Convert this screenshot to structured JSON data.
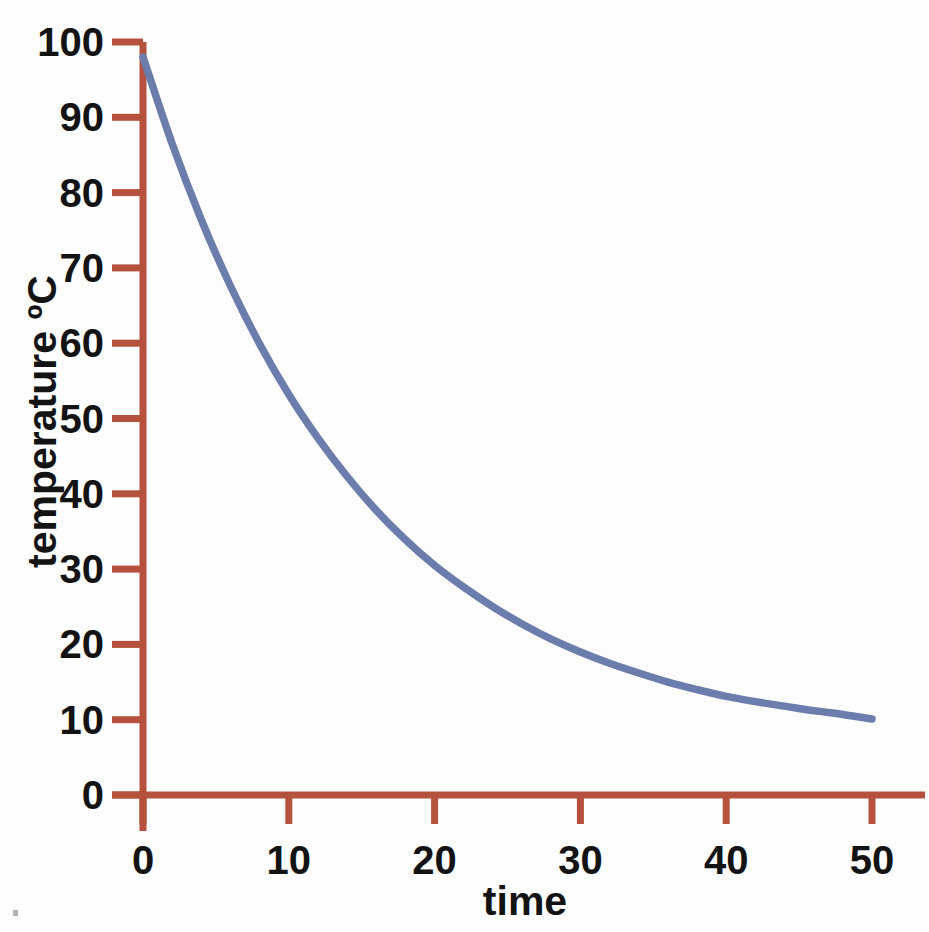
{
  "chart_data": {
    "type": "line",
    "title": "",
    "title_note": "title row is cropped off the top edge of the screenshot and is illegible",
    "xlabel": "time",
    "ylabel": "temperature ºC",
    "xlim": [
      0,
      50
    ],
    "ylim": [
      0,
      100
    ],
    "xticks": [
      0,
      10,
      20,
      30,
      40,
      50
    ],
    "yticks": [
      0,
      10,
      20,
      30,
      40,
      50,
      60,
      70,
      80,
      90,
      100
    ],
    "xtick_labels": [
      "0",
      "10",
      "20",
      "30",
      "40",
      "50"
    ],
    "ytick_labels": [
      "0",
      "10",
      "20",
      "30",
      "40",
      "50",
      "60",
      "70",
      "80",
      "90",
      "100"
    ],
    "grid": false,
    "legend": false,
    "legend_position": "none",
    "asymptote": 10,
    "series": [
      {
        "name": "cooling curve",
        "color": "#6b7dad",
        "x": [
          0,
          2,
          4,
          6,
          8,
          10,
          12,
          14,
          16,
          18,
          20,
          22,
          24,
          26,
          28,
          30,
          32,
          34,
          36,
          38,
          40,
          42,
          44,
          46,
          48,
          50
        ],
        "y": [
          98,
          86.5,
          76.4,
          67.6,
          59.9,
          53.2,
          47.4,
          42.3,
          37.8,
          33.9,
          30.5,
          27.6,
          25.0,
          22.7,
          20.7,
          19.0,
          17.5,
          16.2,
          15.0,
          14.0,
          13.1,
          12.4,
          11.8,
          11.2,
          10.7,
          10.1
        ]
      }
    ]
  },
  "axes": {
    "axis_color": "#b5513c",
    "curve_color": "#6b7dad",
    "text_color": "#131313",
    "background": "#fdfdfd"
  },
  "labels": {
    "x_axis_title": "time",
    "y_axis_title": "temperature ºC",
    "chart_title": ""
  }
}
